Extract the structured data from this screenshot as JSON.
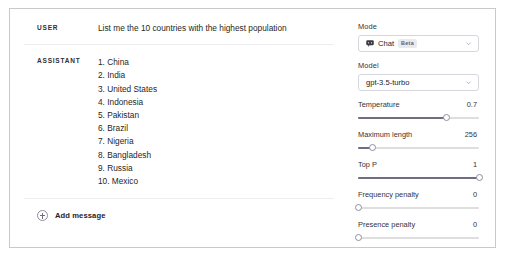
{
  "conversation": {
    "messages": [
      {
        "role": "USER",
        "text": "List me the 10 countries with the highest population"
      },
      {
        "role": "ASSISTANT",
        "items": [
          "1. China",
          "2. India",
          "3. United States",
          "4. Indonesia",
          "5. Pakistan",
          "6. Brazil",
          "7. Nigeria",
          "8. Bangladesh",
          "9. Russia",
          "10. Mexico"
        ]
      }
    ],
    "add_message_label": "Add message",
    "add_message_icon": "plus-circle-icon"
  },
  "settings": {
    "mode": {
      "label": "Mode",
      "value": "Chat",
      "badge": "Beta",
      "icon": "chat-bubble-icon",
      "chevron": "chevron-down-icon"
    },
    "model": {
      "label": "Model",
      "value": "gpt-3.5-turbo",
      "chevron": "chevron-down-icon"
    },
    "sliders": [
      {
        "label": "Temperature",
        "value": "0.7",
        "percent": 73
      },
      {
        "label": "Maximum length",
        "value": "256",
        "percent": 12
      },
      {
        "label": "Top P",
        "value": "1",
        "percent": 100
      },
      {
        "label": "Frequency penalty",
        "value": "0",
        "percent": 0
      },
      {
        "label": "Presence penalty",
        "value": "0",
        "percent": 0
      }
    ]
  },
  "colors": {
    "border": "#c9c9cd",
    "divider": "#ececf1",
    "track": "#dededf",
    "track_fill": "#6e6e80",
    "badge_bg": "#e9e9ef"
  }
}
